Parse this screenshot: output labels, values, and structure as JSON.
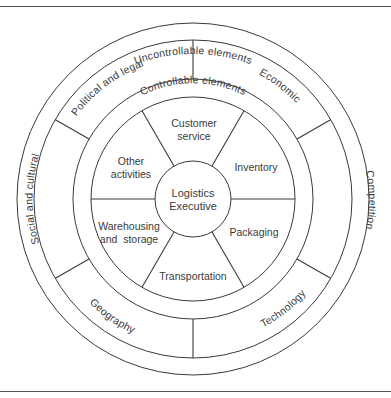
{
  "diagram": {
    "type": "concentric-wheel",
    "center": {
      "label_line1": "Logistics",
      "label_line2": "Executive"
    },
    "outer_band": {
      "title": "Uncontrollable elements"
    },
    "uncontrollable_segments": [
      {
        "label": "Political and legal"
      },
      {
        "label": "Economic"
      },
      {
        "label": "Competition"
      },
      {
        "label": "Technology"
      },
      {
        "label": "Geography"
      },
      {
        "label": "Social and cultural"
      }
    ],
    "inner_band": {
      "title": "Controllable elements"
    },
    "controllable_segments": [
      {
        "line1": "Customer",
        "line2": "service"
      },
      {
        "line1": "Inventory",
        "line2": ""
      },
      {
        "line1": "Packaging",
        "line2": ""
      },
      {
        "line1": "Transportation",
        "line2": ""
      },
      {
        "line1": "Warehousing",
        "line2": "and  storage"
      },
      {
        "line1": "Other",
        "line2": "activities"
      }
    ],
    "colors": {
      "line": "#3a3a3a",
      "text": "#3a3a3a",
      "background": "#ffffff"
    }
  }
}
